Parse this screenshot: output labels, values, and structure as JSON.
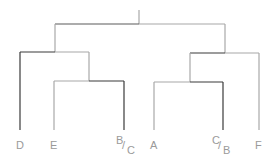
{
  "colors": {
    "dark": "#3a3a3a",
    "gray": "#a8a8a8",
    "label": "#9a9a9a"
  },
  "leaves": [
    {
      "id": "D",
      "label": "D"
    },
    {
      "id": "E",
      "label": "E"
    },
    {
      "id": "BC",
      "num": "B",
      "den": "C"
    },
    {
      "id": "A",
      "label": "A"
    },
    {
      "id": "CB",
      "num": "C",
      "den": "B"
    },
    {
      "id": "F",
      "label": "F"
    }
  ]
}
